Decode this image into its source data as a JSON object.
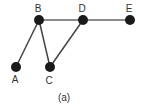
{
  "graph": {
    "caption": "(a)",
    "node_color": "#1a1a1a",
    "edge_color": "#444444",
    "nodes": [
      {
        "id": "A",
        "label": "A",
        "x": 16,
        "y": 67
      },
      {
        "id": "B",
        "label": "B",
        "x": 39,
        "y": 20
      },
      {
        "id": "C",
        "label": "C",
        "x": 50,
        "y": 67
      },
      {
        "id": "D",
        "label": "D",
        "x": 83,
        "y": 20
      },
      {
        "id": "E",
        "label": "E",
        "x": 130,
        "y": 20
      }
    ],
    "edges": [
      {
        "from": "B",
        "to": "A"
      },
      {
        "from": "B",
        "to": "C"
      },
      {
        "from": "B",
        "to": "D"
      },
      {
        "from": "D",
        "to": "C"
      },
      {
        "from": "D",
        "to": "E"
      }
    ]
  }
}
